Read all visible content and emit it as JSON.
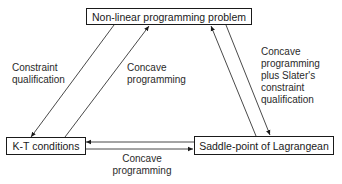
{
  "nodes": {
    "nlp": {
      "label": "Non-linear programming problem"
    },
    "kt": {
      "label": "K-T conditions"
    },
    "saddle": {
      "label": "Saddle-point of Lagrangean"
    }
  },
  "edges": {
    "nlp_to_kt": {
      "label_line1": "Constraint",
      "label_line2": "qualification"
    },
    "kt_to_nlp": {
      "label_line1": "Concave",
      "label_line2": "programming"
    },
    "nlp_to_saddle": {
      "label_line1": "Concave",
      "label_line2": "programming",
      "label_line3": "plus Slater's",
      "label_line4": "constraint",
      "label_line5": "qualification"
    },
    "saddle_to_kt": {
      "label_line1": "Concave",
      "label_line2": "programming"
    }
  }
}
